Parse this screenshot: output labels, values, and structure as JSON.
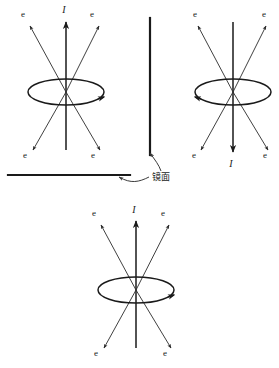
{
  "figure": {
    "colors": {
      "ink": "#1a1a1a",
      "ray": "#2a2a2a",
      "background": "#ffffff"
    },
    "labels": {
      "current": "I",
      "electron": "e",
      "mirror": "镜面"
    },
    "diagrams": [
      {
        "id": "original",
        "name": "top-left-current-loop",
        "center": {
          "x": 66,
          "y": 92
        },
        "ellipse": {
          "rx": 38,
          "ry": 13
        },
        "current_direction": "up",
        "current_label": "I",
        "current_label_pos": {
          "x": 64,
          "y": 13
        },
        "loop_arrow_side": "right",
        "electron_labels": [
          {
            "text": "e",
            "x": 23,
            "y": 17
          },
          {
            "text": "e",
            "x": 92,
            "y": 17
          },
          {
            "text": "e",
            "x": 25,
            "y": 158
          },
          {
            "text": "e",
            "x": 93,
            "y": 158
          }
        ]
      },
      {
        "id": "mirror-image",
        "name": "top-right-mirror-loop",
        "center": {
          "x": 233,
          "y": 92
        },
        "ellipse": {
          "rx": 38,
          "ry": 13
        },
        "current_direction": "down",
        "current_label": "I",
        "current_label_pos": {
          "x": 231,
          "y": 165
        },
        "loop_arrow_side": "left",
        "electron_labels": [
          {
            "text": "e",
            "x": 195,
            "y": 17
          },
          {
            "text": "e",
            "x": 264,
            "y": 17
          },
          {
            "text": "e",
            "x": 196,
            "y": 158
          },
          {
            "text": "e",
            "x": 265,
            "y": 158
          }
        ]
      },
      {
        "id": "actual-reflection",
        "name": "bottom-current-loop",
        "center": {
          "x": 136,
          "y": 290
        },
        "ellipse": {
          "rx": 38,
          "ry": 13
        },
        "current_direction": "up",
        "current_label": "I",
        "current_label_pos": {
          "x": 134,
          "y": 212
        },
        "loop_arrow_side": "right",
        "electron_labels": [
          {
            "text": "e",
            "x": 95,
            "y": 216
          },
          {
            "text": "e",
            "x": 163,
            "y": 216
          },
          {
            "text": "e",
            "x": 97,
            "y": 356
          },
          {
            "text": "e",
            "x": 165,
            "y": 356
          }
        ]
      }
    ],
    "mirrors": [
      {
        "id": "horizontal-mirror",
        "name": "horizontal-mirror-surface",
        "x1": 8,
        "y1": 175,
        "x2": 130,
        "y2": 175
      },
      {
        "id": "vertical-mirror",
        "name": "vertical-mirror-surface",
        "x1": 150,
        "y1": 18,
        "x2": 150,
        "y2": 155
      }
    ],
    "mirror_annotation": {
      "text": "镜面",
      "text_x": 152,
      "text_y": 179,
      "leader_to_horizontal": "M 148 176 C 138 180, 130 182, 118 176",
      "leader_to_vertical": "M 160 170 C 158 164, 154 160, 150 153"
    }
  }
}
